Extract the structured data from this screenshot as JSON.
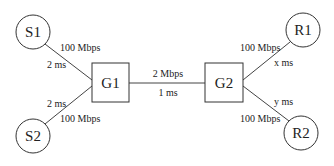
{
  "diagram": {
    "nodes": {
      "s1": {
        "label": "S1",
        "shape": "circle"
      },
      "s2": {
        "label": "S2",
        "shape": "circle"
      },
      "g1": {
        "label": "G1",
        "shape": "square"
      },
      "g2": {
        "label": "G2",
        "shape": "square"
      },
      "r1": {
        "label": "R1",
        "shape": "circle"
      },
      "r2": {
        "label": "R2",
        "shape": "circle"
      }
    },
    "links": {
      "s1_g1": {
        "bandwidth": "100 Mbps",
        "delay": "2 ms"
      },
      "s2_g1": {
        "bandwidth": "100 Mbps",
        "delay": "2 ms"
      },
      "g1_g2": {
        "bandwidth": "2 Mbps",
        "delay": "1 ms"
      },
      "g2_r1": {
        "bandwidth": "100 Mbps",
        "delay": "x ms"
      },
      "g2_r2": {
        "bandwidth": "100 Mbps",
        "delay": "y ms"
      }
    },
    "colors": {
      "stroke": "#333333",
      "background": "#ffffff"
    }
  }
}
